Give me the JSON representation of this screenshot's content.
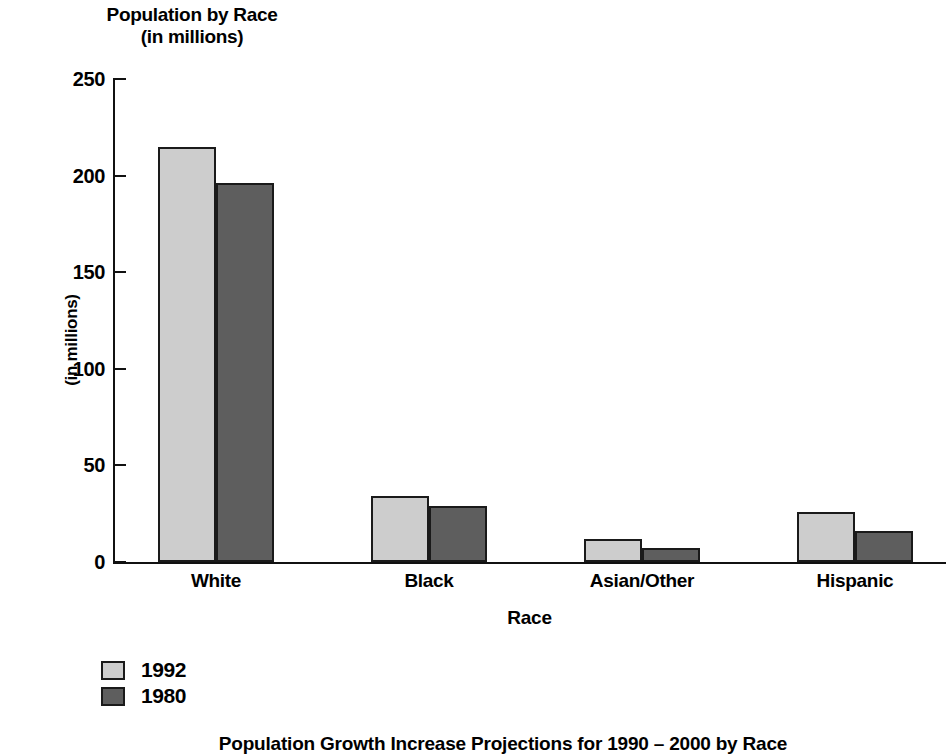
{
  "chart_data": {
    "type": "bar",
    "title": "Population by Race",
    "subtitle": "(in millions)",
    "xlabel": "Race",
    "ylabel": "(in millions)",
    "categories": [
      "White",
      "Black",
      "Asian/Other",
      "Hispanic"
    ],
    "series": [
      {
        "name": "1992",
        "color": "#cdcdcd",
        "values": [
          215,
          34,
          12,
          26
        ]
      },
      {
        "name": "1980",
        "color": "#5e5e5e",
        "values": [
          196,
          29,
          7,
          16
        ]
      }
    ],
    "ylim": [
      0,
      250
    ],
    "yticks": [
      0,
      50,
      100,
      150,
      200,
      250
    ],
    "ytick_labels": [
      "0",
      "50",
      "100",
      "150",
      "200",
      "250"
    ],
    "grid": false,
    "legend_position": "below-left",
    "caption": "Population Growth Increase Projections for 1990 – 2000 by Race"
  }
}
